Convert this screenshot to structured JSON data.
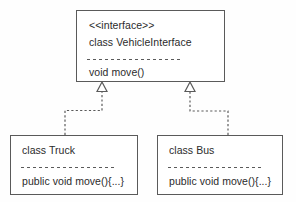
{
  "diagram": {
    "type": "uml-class-diagram",
    "background_color": "#fefefe",
    "line_color": "#5a5a5a",
    "text_color": "#2b2b2b"
  },
  "interface_box": {
    "stereotype": "<<interface>>",
    "name": "class VehicleInterface",
    "method": "void move()"
  },
  "truck_box": {
    "name": "class Truck",
    "method": "public void move(){...}"
  },
  "bus_box": {
    "name": "class Bus",
    "method": "public void move(){...}"
  },
  "connectors": [
    {
      "name": "truck-realizes-interface",
      "from": "class Truck",
      "to": "class VehicleInterface",
      "relationship": "realization",
      "line_style": "dashed",
      "arrowhead": "hollow-triangle"
    },
    {
      "name": "bus-realizes-interface",
      "from": "class Bus",
      "to": "class VehicleInterface",
      "relationship": "realization",
      "line_style": "dashed",
      "arrowhead": "hollow-triangle"
    }
  ]
}
